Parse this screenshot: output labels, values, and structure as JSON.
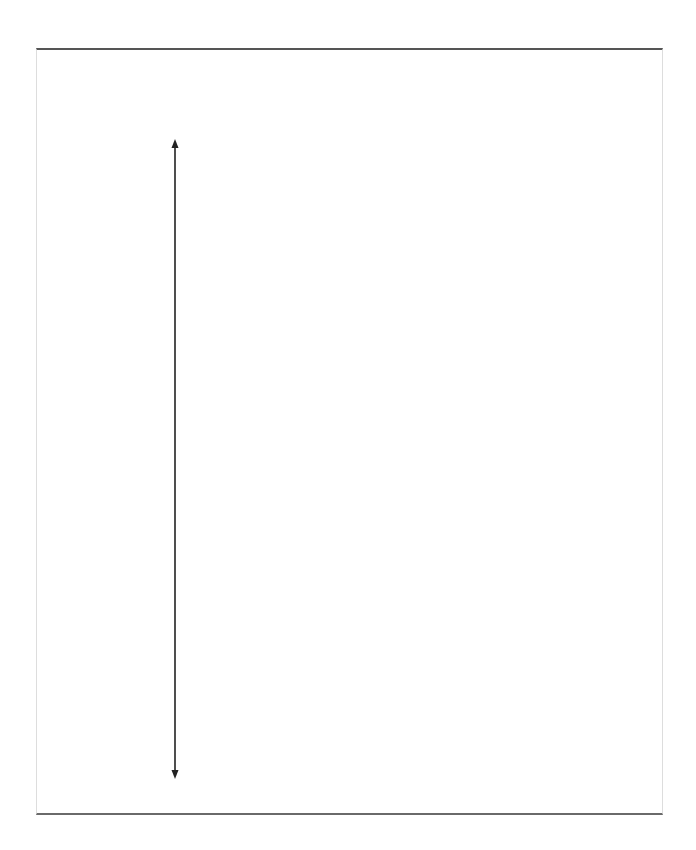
{
  "diagram": {
    "frame": {
      "x": 36,
      "y": 48,
      "width": 627,
      "height": 767,
      "border_color": "#555555"
    },
    "arrow": {
      "type": "double-headed-vertical",
      "x": 175,
      "y_start": 140,
      "y_end": 778,
      "color": "#222222"
    }
  }
}
